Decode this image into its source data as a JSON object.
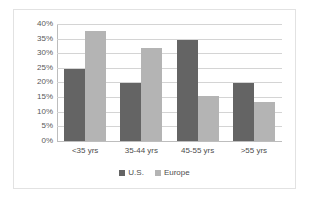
{
  "chart_data": {
    "type": "bar",
    "title": "",
    "xlabel": "",
    "ylabel": "",
    "categories": [
      "<35 yrs",
      "35-44 yrs",
      "45-55 yrs",
      ">55 yrs"
    ],
    "series": [
      {
        "name": "U.S.",
        "color": "#646464",
        "values": [
          25,
          20,
          35,
          20
        ]
      },
      {
        "name": "Europe",
        "color": "#b4b4b4",
        "values": [
          38,
          32,
          15.5,
          13.5
        ]
      }
    ],
    "ylim": [
      0,
      40
    ],
    "ytick_labels": [
      "40%",
      "35%",
      "30%",
      "25%",
      "20%",
      "15%",
      "10%",
      "5%",
      "0%"
    ],
    "ytick_values": [
      40,
      35,
      30,
      25,
      20,
      15,
      10,
      5,
      0
    ],
    "grid": true,
    "legend_position": "bottom"
  },
  "legend": {
    "entries": [
      {
        "label": "U.S."
      },
      {
        "label": "Europe"
      }
    ]
  }
}
